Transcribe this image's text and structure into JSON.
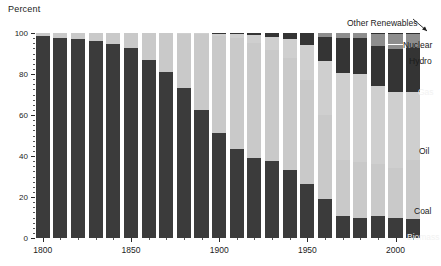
{
  "chart_data": {
    "type": "bar",
    "stacked": true,
    "title": "",
    "ylabel": "Percent",
    "xlabel": "",
    "ylim": [
      0,
      100
    ],
    "xlim": [
      1795,
      2015
    ],
    "grid": false,
    "legend_position": "inline-right",
    "y_ticks": [
      0,
      20,
      40,
      60,
      80,
      100
    ],
    "y_tick_labels": [
      "0",
      "20",
      "40",
      "60",
      "80",
      "100"
    ],
    "x_ticks": [
      1800,
      1850,
      1900,
      1950,
      2000
    ],
    "x_tick_labels": [
      "1800",
      "1850",
      "1900",
      "1950",
      "2000"
    ],
    "categories": [
      1800,
      1810,
      1820,
      1830,
      1840,
      1850,
      1860,
      1870,
      1880,
      1890,
      1900,
      1910,
      1920,
      1930,
      1940,
      1950,
      1960,
      1970,
      1980,
      1990,
      2000,
      2010
    ],
    "series": [
      {
        "name": "Biomass",
        "color": "#3b3b3b",
        "values": [
          98.5,
          97.5,
          97.0,
          96.0,
          94.5,
          92.5,
          87.0,
          81.0,
          73.0,
          62.5,
          51.0,
          43.5,
          39.0,
          37.5,
          33.0,
          26.5,
          19.0,
          10.5,
          10.0,
          10.5,
          10.0,
          9.5
        ]
      },
      {
        "name": "Coal",
        "color": "#c9c9c9",
        "values": [
          1.5,
          2.5,
          3.0,
          4.0,
          5.5,
          7.5,
          13.0,
          19.0,
          26.5,
          37.0,
          47.5,
          54.0,
          56.0,
          54.0,
          55.0,
          50.5,
          41.0,
          27.5,
          27.0,
          25.5,
          24.0,
          28.5
        ]
      },
      {
        "name": "Oil",
        "color": "#cfcfcf",
        "values": [
          0.0,
          0.0,
          0.0,
          0.0,
          0.0,
          0.0,
          0.0,
          0.0,
          0.5,
          0.5,
          1.0,
          2.0,
          4.0,
          6.5,
          9.0,
          17.0,
          26.5,
          42.5,
          43.0,
          38.0,
          37.0,
          33.0
        ]
      },
      {
        "name": "Gas",
        "color": "#343434",
        "values": [
          0.0,
          0.0,
          0.0,
          0.0,
          0.0,
          0.0,
          0.0,
          0.0,
          0.0,
          0.0,
          0.5,
          0.5,
          1.0,
          2.0,
          3.0,
          6.0,
          11.5,
          17.0,
          17.5,
          19.5,
          21.0,
          21.5
        ]
      },
      {
        "name": "Hydro",
        "color": "#8d8d8d",
        "values": [
          0.0,
          0.0,
          0.0,
          0.0,
          0.0,
          0.0,
          0.0,
          0.0,
          0.0,
          0.0,
          0.0,
          0.0,
          0.0,
          0.0,
          0.0,
          0.0,
          2.0,
          2.0,
          2.0,
          2.3,
          2.4,
          2.5
        ]
      },
      {
        "name": "Nuclear",
        "color": "#8d8d8d",
        "values": [
          0.0,
          0.0,
          0.0,
          0.0,
          0.0,
          0.0,
          0.0,
          0.0,
          0.0,
          0.0,
          0.0,
          0.0,
          0.0,
          0.0,
          0.0,
          0.0,
          0.0,
          0.5,
          0.5,
          4.0,
          5.3,
          4.5
        ]
      },
      {
        "name": "Other Renewables",
        "color": "#2f2f2f",
        "values": [
          0.0,
          0.0,
          0.0,
          0.0,
          0.0,
          0.0,
          0.0,
          0.0,
          0.0,
          0.0,
          0.0,
          0.0,
          0.0,
          0.0,
          0.0,
          0.0,
          0.0,
          0.0,
          0.0,
          0.2,
          0.3,
          0.5
        ]
      }
    ],
    "annotations": [
      {
        "text": "Other Renewables",
        "kind": "callout",
        "x": 347,
        "y": 18
      },
      {
        "text": "Nuclear",
        "kind": "inline",
        "x": 403,
        "y": 41,
        "tone": "dark"
      },
      {
        "text": "Hydro",
        "kind": "inline",
        "x": 409,
        "y": 57,
        "tone": "dark"
      },
      {
        "text": "Gas",
        "kind": "inline",
        "x": 418,
        "y": 88,
        "tone": "light"
      },
      {
        "text": "Oil",
        "kind": "inline",
        "x": 419,
        "y": 147,
        "tone": "dark"
      },
      {
        "text": "Coal",
        "kind": "inline",
        "x": 414,
        "y": 207,
        "tone": "dark"
      },
      {
        "text": "Biomass",
        "kind": "inline",
        "x": 407,
        "y": 233,
        "tone": "light"
      }
    ]
  }
}
